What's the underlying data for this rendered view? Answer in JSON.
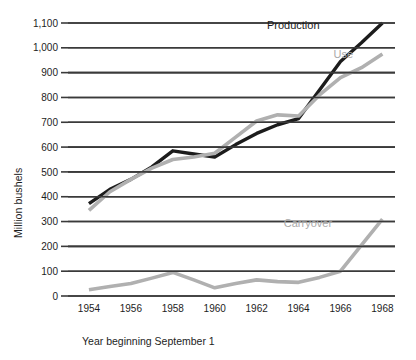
{
  "chart_data": {
    "type": "line",
    "title": "",
    "xlabel": "Year beginning September 1",
    "ylabel": "Million bushels",
    "xlim": [
      1953,
      1968.6
    ],
    "ylim": [
      0,
      1100
    ],
    "grid": true,
    "legend_position": "inline-labels",
    "y_ticks": [
      "0",
      "100",
      "200",
      "300",
      "400",
      "500",
      "600",
      "700",
      "800",
      "900",
      "1,000",
      "1,100"
    ],
    "y_tick_values": [
      0,
      100,
      200,
      300,
      400,
      500,
      600,
      700,
      800,
      900,
      1000,
      1100
    ],
    "x_ticks": [
      "1954",
      "1956",
      "1958",
      "1960",
      "1962",
      "1964",
      "1966",
      "1968"
    ],
    "x_tick_values": [
      1954,
      1956,
      1958,
      1960,
      1962,
      1964,
      1966,
      1968
    ],
    "x": [
      1954,
      1955,
      1956,
      1957,
      1958,
      1959,
      1960,
      1961,
      1962,
      1963,
      1964,
      1965,
      1966,
      1967,
      1968
    ],
    "series": [
      {
        "name": "Production",
        "color": "#1c1c1c",
        "values": [
          372,
          430,
          470,
          520,
          585,
          572,
          560,
          610,
          655,
          690,
          715,
          830,
          945,
          1020,
          1100
        ]
      },
      {
        "name": "Use",
        "color": "#b0b0b0",
        "values": [
          345,
          420,
          470,
          515,
          550,
          560,
          575,
          640,
          705,
          730,
          725,
          810,
          880,
          920,
          975
        ]
      },
      {
        "name": "Carryover",
        "color": "#b0b0b0",
        "values": [
          25,
          38,
          50,
          72,
          95,
          65,
          33,
          50,
          65,
          58,
          55,
          75,
          100,
          205,
          310
        ]
      }
    ],
    "annotations": [
      {
        "text": "Production",
        "series": "Production",
        "x": 1965.0,
        "y": 1075
      },
      {
        "text": "Use",
        "series": "Use",
        "x": 1966.6,
        "y": 960
      },
      {
        "text": "Carryover",
        "series": "Carryover",
        "x": 1965.6,
        "y": 280
      }
    ]
  }
}
